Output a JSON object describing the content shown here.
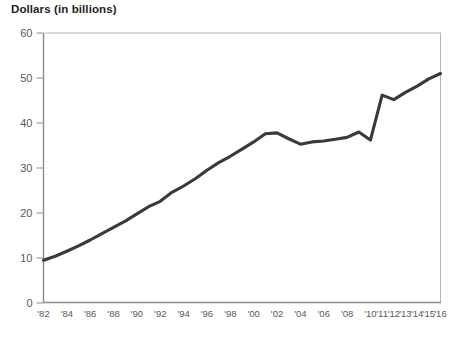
{
  "chart_title": "Dollars (in billions)",
  "chart_data": {
    "type": "line",
    "title": "Dollars (in billions)",
    "xlabel": "",
    "ylabel": "Dollars (in billions)",
    "ylim": [
      0,
      60
    ],
    "ytick_labels": [
      "60",
      "50",
      "40",
      "30",
      "20",
      "10",
      "0"
    ],
    "ytick_values": [
      60,
      50,
      40,
      30,
      20,
      10,
      0
    ],
    "grid": false,
    "legend": "none",
    "line_color": "#3a3a3c",
    "xtick_labels": [
      "'82",
      "'84",
      "'86",
      "'88",
      "'90",
      "'92",
      "'94",
      "'96",
      "'98",
      "'00",
      "'02",
      "'04",
      "'06",
      "'08",
      "'10",
      "'11",
      "'12",
      "'13",
      "'14",
      "'15",
      "'16"
    ],
    "x": [
      1982,
      1983,
      1984,
      1985,
      1986,
      1987,
      1988,
      1989,
      1990,
      1991,
      1992,
      1993,
      1994,
      1995,
      1996,
      1997,
      1998,
      1999,
      2000,
      2001,
      2002,
      2003,
      2004,
      2005,
      2006,
      2007,
      2008,
      2009,
      2010,
      2011,
      2012,
      2013,
      2014,
      2015,
      2016
    ],
    "values": [
      9.5,
      10.4,
      11.5,
      12.7,
      14.0,
      15.4,
      16.8,
      18.2,
      19.8,
      21.4,
      22.6,
      24.6,
      26.0,
      27.6,
      29.5,
      31.2,
      32.6,
      34.2,
      35.8,
      37.6,
      37.8,
      36.5,
      35.3,
      35.8,
      36.0,
      36.4,
      36.8,
      38.0,
      36.2,
      46.2,
      45.2,
      46.8,
      48.2,
      49.8,
      51.0
    ]
  }
}
